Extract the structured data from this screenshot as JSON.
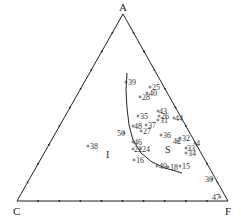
{
  "diagram": {
    "type": "ternary",
    "vertices": {
      "top": {
        "label": "A",
        "x": 123,
        "y": 14
      },
      "left": {
        "label": "C",
        "x": 17,
        "y": 201
      },
      "right": {
        "label": "F",
        "x": 228,
        "y": 201
      }
    },
    "regions": [
      {
        "label": "I",
        "x": 106,
        "y": 158
      },
      {
        "label": "S",
        "x": 165,
        "y": 153
      }
    ],
    "boundary_curve": [
      [
        127,
        73
      ],
      [
        126,
        90
      ],
      [
        127,
        108
      ],
      [
        129,
        125
      ],
      [
        133,
        140
      ],
      [
        141,
        153
      ],
      [
        152,
        162
      ],
      [
        165,
        168
      ],
      [
        182,
        173
      ]
    ],
    "points": [
      {
        "label": "39",
        "x": 126,
        "y": 82,
        "label_dx": 2
      },
      {
        "label": "25",
        "x": 150,
        "y": 87,
        "label_dx": 2
      },
      {
        "label": "40",
        "x": 147,
        "y": 93,
        "label_dx": 2
      },
      {
        "label": "28",
        "x": 140,
        "y": 97,
        "label_dx": 2
      },
      {
        "label": "43",
        "x": 158,
        "y": 111,
        "label_dx": 1
      },
      {
        "label": "35",
        "x": 138,
        "y": 116,
        "label_dx": 2
      },
      {
        "label": "26",
        "x": 159,
        "y": 116,
        "label_dx": 2
      },
      {
        "label": "31",
        "x": 158,
        "y": 120,
        "label_dx": 2
      },
      {
        "label": "44",
        "x": 174,
        "y": 118,
        "label_dx": 1
      },
      {
        "label": "48",
        "x": 133,
        "y": 126,
        "label_dx": 1
      },
      {
        "label": "37",
        "x": 146,
        "y": 125,
        "label_dx": 2
      },
      {
        "label": "27",
        "x": 141,
        "y": 131,
        "label_dx": 2
      },
      {
        "label": "50",
        "x": 124,
        "y": 133,
        "label_dx": -7
      },
      {
        "label": "36",
        "x": 161,
        "y": 135,
        "label_dx": 2
      },
      {
        "label": "32",
        "x": 180,
        "y": 138,
        "label_dx": 2
      },
      {
        "label": "42",
        "x": 178,
        "y": 141,
        "label_dx": -5
      },
      {
        "label": "4",
        "x": 195,
        "y": 143,
        "label_dx": 1
      },
      {
        "label": "46",
        "x": 133,
        "y": 142,
        "label_dx": 1
      },
      {
        "label": "24",
        "x": 140,
        "y": 149,
        "label_dx": 2
      },
      {
        "label": "22",
        "x": 133,
        "y": 149,
        "label_dx": 1
      },
      {
        "label": "33",
        "x": 186,
        "y": 148,
        "label_dx": 1
      },
      {
        "label": "34",
        "x": 186,
        "y": 153,
        "label_dx": 2
      },
      {
        "label": "38",
        "x": 88,
        "y": 146,
        "label_dx": 2
      },
      {
        "label": "16",
        "x": 134,
        "y": 160,
        "label_dx": 2
      },
      {
        "label": "49",
        "x": 157,
        "y": 166,
        "label_dx": 2
      },
      {
        "label": "18",
        "x": 168,
        "y": 167,
        "label_dx": 2
      },
      {
        "label": "15",
        "x": 180,
        "y": 166,
        "label_dx": 2
      },
      {
        "label": "30",
        "x": 212,
        "y": 179,
        "label_dx": -7
      },
      {
        "label": "47",
        "x": 220,
        "y": 197,
        "label_dx": -8
      }
    ]
  }
}
